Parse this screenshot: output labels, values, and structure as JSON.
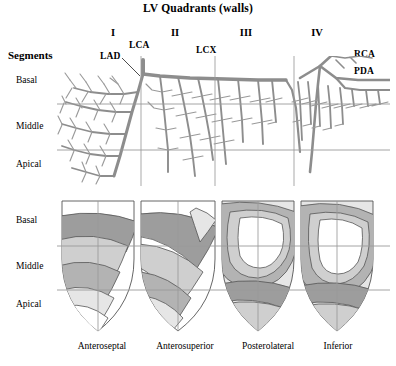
{
  "figure": {
    "title": "LV Quadrants (walls)",
    "segments_header": "Segments"
  },
  "quadrants": [
    {
      "numeral": "I",
      "wall": "Anteroseptal"
    },
    {
      "numeral": "II",
      "wall": "Anterosuperior"
    },
    {
      "numeral": "III",
      "wall": "Posterolateral"
    },
    {
      "numeral": "IV",
      "wall": "Inferior"
    }
  ],
  "arteries": [
    {
      "abbr": "LCA"
    },
    {
      "abbr": "LAD"
    },
    {
      "abbr": "LCX"
    },
    {
      "abbr": "RCA"
    },
    {
      "abbr": "PDA"
    }
  ],
  "segment_rows": [
    {
      "label": "Basal"
    },
    {
      "label": "Middle"
    },
    {
      "label": "Apical"
    }
  ],
  "panels": {
    "upper": {
      "name": "coronary-arterial-tree"
    },
    "lower": {
      "name": "lv-wall-contour-maps"
    }
  },
  "colors": {
    "ink": "#000000",
    "grid": "#9a9a9a",
    "vessel": "#8d8d8d",
    "band_light": "#e6e6e6",
    "band_mid": "#cfcfcf",
    "band_dark": "#b3b3b3",
    "band_darker": "#9d9d9d",
    "outline": "#555555",
    "paper": "#ffffff"
  }
}
